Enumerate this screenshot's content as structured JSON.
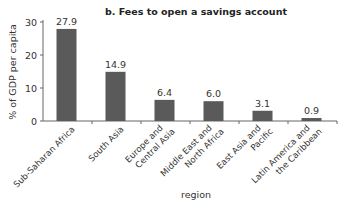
{
  "chart_data": {
    "type": "bar",
    "title": "b. Fees to open a savings account",
    "xlabel": "region",
    "ylabel": "% of GDP per capita",
    "ylim": [
      0,
      30
    ],
    "yticks": [
      0,
      10,
      20,
      30
    ],
    "ytick_labels": [
      "0",
      "10",
      "20",
      "30"
    ],
    "categories": [
      [
        "Sub-Saharan Africa"
      ],
      [
        "South Asia"
      ],
      [
        "Europe and",
        "Central Asia"
      ],
      [
        "Middle East and",
        "North Africa"
      ],
      [
        "East Asia and",
        "Pacific"
      ],
      [
        "Latin America and",
        "the Caribbean"
      ]
    ],
    "values": [
      27.9,
      14.9,
      6.4,
      6.0,
      3.1,
      0.9
    ],
    "data_labels": [
      "27.9",
      "14.9",
      "6.4",
      "6.0",
      "3.1",
      "0.9"
    ],
    "bar_color": "#5a5a5a",
    "grid": false,
    "legend": "none"
  }
}
